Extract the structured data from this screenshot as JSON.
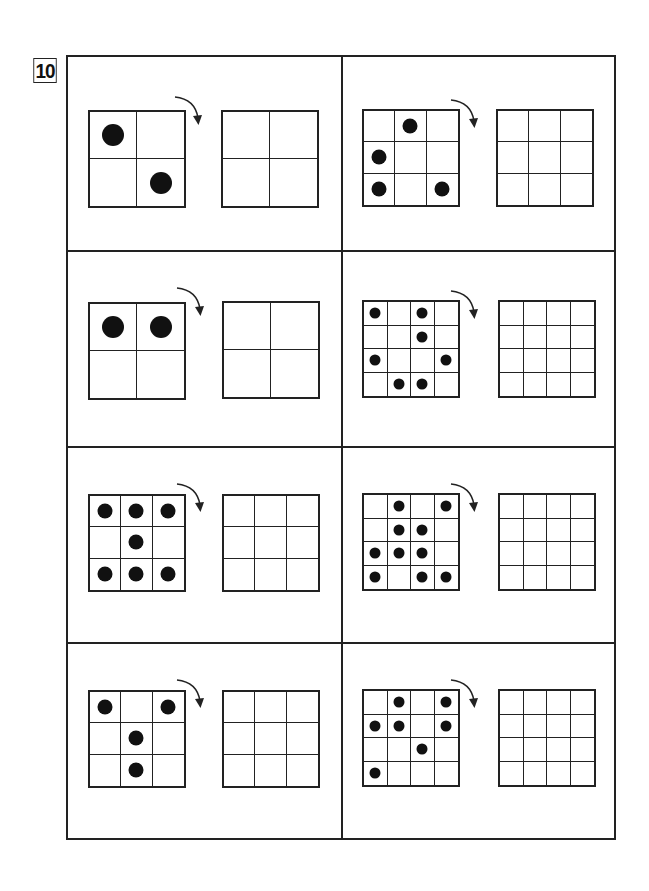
{
  "question_number": "10",
  "instruction_icon": "rotate-clockwise-arrow",
  "colors": {
    "line": "#222222",
    "dot": "#111111",
    "background": "#ffffff"
  },
  "puzzles": [
    {
      "id": "r1c1",
      "size": 2,
      "dots": [
        [
          0,
          0
        ],
        [
          1,
          1
        ]
      ]
    },
    {
      "id": "r1c2",
      "size": 3,
      "dots": [
        [
          0,
          1
        ],
        [
          1,
          0
        ],
        [
          2,
          0
        ],
        [
          2,
          2
        ]
      ]
    },
    {
      "id": "r2c1",
      "size": 2,
      "dots": [
        [
          0,
          0
        ],
        [
          0,
          1
        ]
      ]
    },
    {
      "id": "r2c2",
      "size": 4,
      "dots": [
        [
          0,
          0
        ],
        [
          0,
          2
        ],
        [
          1,
          2
        ],
        [
          2,
          0
        ],
        [
          2,
          3
        ],
        [
          3,
          1
        ],
        [
          3,
          2
        ]
      ]
    },
    {
      "id": "r3c1",
      "size": 3,
      "dots": [
        [
          0,
          0
        ],
        [
          0,
          1
        ],
        [
          0,
          2
        ],
        [
          1,
          1
        ],
        [
          2,
          0
        ],
        [
          2,
          1
        ],
        [
          2,
          2
        ]
      ]
    },
    {
      "id": "r3c2",
      "size": 4,
      "dots": [
        [
          0,
          1
        ],
        [
          0,
          3
        ],
        [
          1,
          1
        ],
        [
          1,
          2
        ],
        [
          2,
          0
        ],
        [
          2,
          1
        ],
        [
          2,
          2
        ],
        [
          3,
          0
        ],
        [
          3,
          2
        ],
        [
          3,
          3
        ]
      ]
    },
    {
      "id": "r4c1",
      "size": 3,
      "dots": [
        [
          0,
          0
        ],
        [
          0,
          2
        ],
        [
          1,
          1
        ],
        [
          2,
          1
        ]
      ]
    },
    {
      "id": "r4c2",
      "size": 4,
      "dots": [
        [
          0,
          1
        ],
        [
          0,
          3
        ],
        [
          1,
          0
        ],
        [
          1,
          1
        ],
        [
          1,
          3
        ],
        [
          2,
          2
        ],
        [
          3,
          0
        ]
      ]
    }
  ]
}
